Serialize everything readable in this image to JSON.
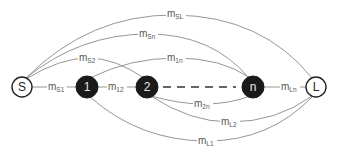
{
  "diagram": {
    "type": "network-graph",
    "nodes": [
      {
        "id": "S",
        "label": "S",
        "style": "open",
        "x": 22,
        "y": 87
      },
      {
        "id": "1",
        "label": "1",
        "style": "filled",
        "x": 87,
        "y": 87
      },
      {
        "id": "2",
        "label": "2",
        "style": "filled",
        "x": 147,
        "y": 87
      },
      {
        "id": "n",
        "label": "n",
        "style": "filled",
        "x": 253,
        "y": 87
      },
      {
        "id": "L",
        "label": "L",
        "style": "open",
        "x": 316,
        "y": 87
      }
    ],
    "edges": [
      {
        "from": "S",
        "to": "L",
        "label_main": "m",
        "label_sub": "SL",
        "style": "solid"
      },
      {
        "from": "S",
        "to": "n",
        "label_main": "m",
        "label_sub": "Sn",
        "style": "solid"
      },
      {
        "from": "S",
        "to": "2",
        "label_main": "m",
        "label_sub": "S2",
        "style": "solid"
      },
      {
        "from": "1",
        "to": "n",
        "label_main": "m",
        "label_sub": "1n",
        "style": "solid"
      },
      {
        "from": "S",
        "to": "1",
        "label_main": "m",
        "label_sub": "S1",
        "style": "solid"
      },
      {
        "from": "1",
        "to": "2",
        "label_main": "m",
        "label_sub": "12",
        "style": "solid"
      },
      {
        "from": "2",
        "to": "n",
        "label_main": "",
        "label_sub": "",
        "style": "dashed"
      },
      {
        "from": "n",
        "to": "L",
        "label_main": "m",
        "label_sub": "Ln",
        "style": "solid"
      },
      {
        "from": "2",
        "to": "n",
        "label_main": "m",
        "label_sub": "2n",
        "style": "solid"
      },
      {
        "from": "2",
        "to": "L",
        "label_main": "m",
        "label_sub": "L2",
        "style": "solid"
      },
      {
        "from": "1",
        "to": "L",
        "label_main": "m",
        "label_sub": "L1",
        "style": "solid"
      }
    ]
  }
}
